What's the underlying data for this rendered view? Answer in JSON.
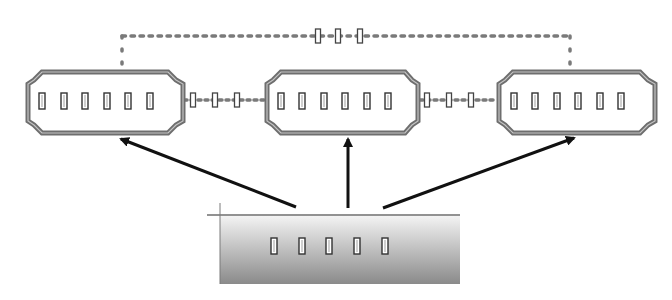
{
  "diagram": {
    "title": "",
    "colors": {
      "background": "#ffffff",
      "frame": "#6e6e6e",
      "frame_inner": "#b9b9b9",
      "slot": "#3a3a3a",
      "dotted": "#7a7a7a",
      "arrow": "#111111",
      "base_top": "#f2f2f2",
      "base_bottom": "#8c8c8c"
    },
    "nodes": [
      {
        "id": "block-left",
        "x": 28,
        "y": 72,
        "w": 155,
        "h": 61,
        "slots": 6
      },
      {
        "id": "block-center",
        "x": 267,
        "y": 72,
        "w": 151,
        "h": 61,
        "slots": 6
      },
      {
        "id": "block-right",
        "x": 499,
        "y": 72,
        "w": 156,
        "h": 61,
        "slots": 6
      }
    ],
    "base": {
      "id": "base-block",
      "x": 220,
      "y": 216,
      "w": 240,
      "h": 68,
      "slots": 5
    },
    "links": [
      {
        "from": "block-left",
        "to": "block-center",
        "style": "dotted",
        "markers": 3
      },
      {
        "from": "block-center",
        "to": "block-right",
        "style": "dotted",
        "markers": 3
      },
      {
        "from": "block-left",
        "to": "block-right",
        "style": "dotted-top-bus",
        "markers": 3
      }
    ],
    "arrows": [
      {
        "from": "base-block",
        "to": "block-left"
      },
      {
        "from": "base-block",
        "to": "block-center"
      },
      {
        "from": "base-block",
        "to": "block-right"
      }
    ]
  }
}
